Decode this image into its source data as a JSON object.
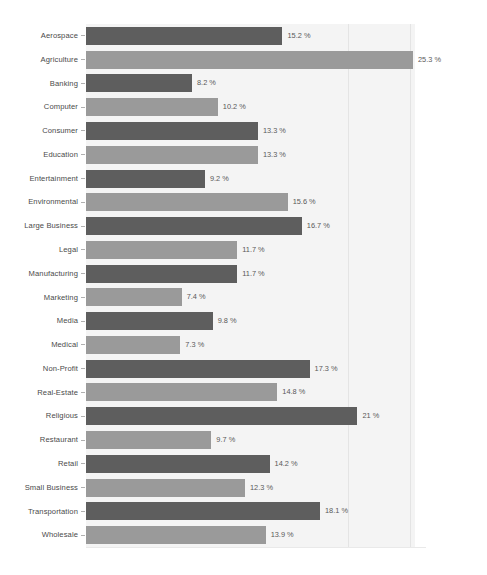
{
  "chart_data": {
    "type": "bar",
    "orientation": "horizontal",
    "title": "",
    "subtitle": "",
    "xlabel": "",
    "ylabel": "",
    "xlim": [
      0,
      25.3
    ],
    "grid": true,
    "legend": false,
    "value_suffix": "%",
    "categories": [
      "Aerospace",
      "Agriculture",
      "Banking",
      "Computer",
      "Consumer",
      "Education",
      "Entertainment",
      "Environmental",
      "Large Business",
      "Legal",
      "Manufacturing",
      "Marketing",
      "Media",
      "Medical",
      "Non-Profit",
      "Real-Estate",
      "Religious",
      "Restaurant",
      "Retail",
      "Small Business",
      "Transportation",
      "Wholesale"
    ],
    "values": [
      15.2,
      25.3,
      8.2,
      10.2,
      13.3,
      13.3,
      9.2,
      15.6,
      16.7,
      11.7,
      11.7,
      7.4,
      9.8,
      7.3,
      17.3,
      14.8,
      21,
      9.7,
      14.2,
      12.3,
      18.1,
      13.9
    ],
    "value_labels": [
      "15.2 %",
      "25.3 %",
      "8.2 %",
      "10.2 %",
      "13.3 %",
      "13.3 %",
      "9.2 %",
      "15.6 %",
      "16.7 %",
      "11.7 %",
      "11.7 %",
      "7.4 %",
      "9.8 %",
      "7.3 %",
      "17.3 %",
      "14.8 %",
      "21 %",
      "9.7 %",
      "14.2 %",
      "12.3 %",
      "18.1 %",
      "13.9 %"
    ],
    "bar_colors": {
      "dark": "#5e5e5e",
      "light": "#9a9a9a"
    },
    "plot_background": "#f4f4f4",
    "page_background": "#ffffff",
    "gridline_color": "#e4e4e4",
    "gridline_values": [
      20.3,
      25.1
    ]
  }
}
